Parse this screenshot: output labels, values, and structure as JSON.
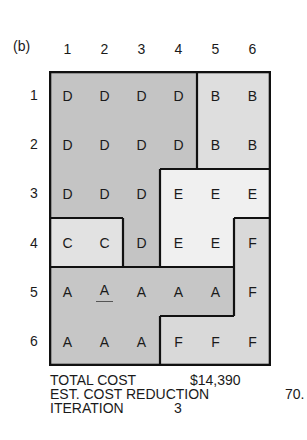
{
  "panel_label": "(b)",
  "columns": [
    "1",
    "2",
    "3",
    "4",
    "5",
    "6"
  ],
  "rows": [
    "1",
    "2",
    "3",
    "4",
    "5",
    "6"
  ],
  "grid": [
    [
      "D",
      "D",
      "D",
      "D",
      "B",
      "B"
    ],
    [
      "D",
      "D",
      "D",
      "D",
      "B",
      "B"
    ],
    [
      "D",
      "D",
      "D",
      "E",
      "E",
      "E"
    ],
    [
      "C",
      "C",
      "D",
      "E",
      "E",
      "F"
    ],
    [
      "A",
      "A",
      "A",
      "A",
      "A",
      "F"
    ],
    [
      "A",
      "A",
      "A",
      "F",
      "F",
      "F"
    ]
  ],
  "underlined_cell": {
    "row": 5,
    "col": 2
  },
  "region_colors": {
    "A": "#c6c6c6",
    "B": "#dedede",
    "C": "#e2e2e2",
    "D": "#c4c4c4",
    "E": "#f0f0f0",
    "F": "#d9d9d9"
  },
  "stats": {
    "total_cost_label": "TOTAL COST",
    "total_cost_value": "$14,390",
    "est_reduction_label": "EST. COST REDUCTION",
    "est_reduction_value": "70.",
    "iteration_label": "ITERATION",
    "iteration_value": "3"
  }
}
